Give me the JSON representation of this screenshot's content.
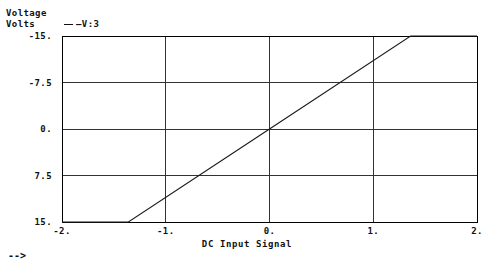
{
  "axes": {
    "y_title_line1": "Voltage",
    "y_title_line2": "Volts",
    "x_title": "DC Input Signal"
  },
  "legend": {
    "marker": "line-dash",
    "label": "—V:3"
  },
  "footer": {
    "arrow": "-->"
  },
  "ticks": {
    "y": [
      "15.",
      "7.5",
      "0.",
      "-7.5",
      "-15."
    ],
    "x": [
      "-2.",
      "-1.",
      "0.",
      "1.",
      "2."
    ]
  },
  "style": {
    "frame_color": "#000000",
    "grid_color": "#333333",
    "trace_color": "#1a1a1a",
    "background": "#ffffff"
  },
  "chart_data": {
    "type": "line",
    "title": "",
    "subtitle": "",
    "xlabel": "DC Input Signal",
    "ylabel": "Voltage Volts",
    "xlim": [
      -2,
      2
    ],
    "ylim": [
      -15,
      15
    ],
    "xticks": [
      -2,
      -1,
      0,
      1,
      2
    ],
    "yticks": [
      -15,
      -7.5,
      0,
      7.5,
      15
    ],
    "xticklabels": [
      "-2.",
      "-1.",
      "0.",
      "1.",
      "2."
    ],
    "yticklabels": [
      "-15.",
      "-7.5",
      "0.",
      "7.5",
      "15."
    ],
    "grid": true,
    "legend_position": "top-left-outside",
    "series": [
      {
        "name": "—V:3",
        "color": "#1a1a1a",
        "x": [
          -2,
          -1.36,
          0,
          1.36,
          2
        ],
        "y": [
          -15,
          -15,
          0,
          15,
          15
        ]
      }
    ],
    "annotations": [
      "flat saturation at -15 V for input below -1.36",
      "linear region through origin, slope about 11 V/V",
      "flat saturation at +15 V for input above 1.36"
    ]
  },
  "geometry": {
    "plot_left": 62,
    "plot_right": 477,
    "plot_top": 36,
    "plot_bottom": 222,
    "y_gridlines_px": [
      36,
      81,
      126,
      170,
      215
    ],
    "x_gridlines_px": [
      62,
      166,
      270,
      374,
      477
    ]
  }
}
